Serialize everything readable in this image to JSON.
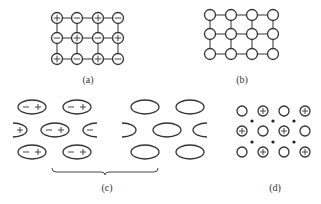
{
  "panels": {
    "a": {
      "caption": "(a)",
      "description": "Square lattice with alternating charged ions connected by lines",
      "rows": [
        [
          "+",
          "−",
          "+",
          "−"
        ],
        [
          "−",
          "+",
          "−",
          "+"
        ],
        [
          "+",
          "−",
          "+",
          "−"
        ]
      ],
      "cols_x": [
        57,
        77,
        98,
        118
      ],
      "rows_y": [
        18,
        38,
        59
      ]
    },
    "b": {
      "caption": "(b)",
      "description": "Square lattice of neutral atoms connected by lines",
      "cols_x": [
        210,
        231,
        252,
        273
      ],
      "rows_y": [
        15,
        34,
        54
      ]
    },
    "c": {
      "caption": "(c)",
      "description": "Polar molecules (dipoles) on the left and nonpolar molecules on the right, grouped by a brace",
      "dipole_signs": [
        "−",
        "+"
      ],
      "left_edge_sign": "+",
      "right_edge_sign": "−"
    },
    "d": {
      "caption": "(d)",
      "description": "Metal lattice: positive ion cores and neutral atoms with free electrons (dots)",
      "rows": [
        [
          "o",
          "+",
          "o",
          "+"
        ],
        [
          "+",
          "o",
          "+",
          "o"
        ],
        [
          "o",
          "+",
          "o",
          "+"
        ]
      ],
      "cols_x": [
        242,
        263,
        284,
        305
      ],
      "rows_y": [
        111,
        131,
        152
      ],
      "electron_cols_x": [
        252,
        273,
        294
      ],
      "electron_rows_y": [
        121,
        142
      ]
    }
  },
  "colors": {
    "stroke": "#333333",
    "background": "#ffffff"
  }
}
